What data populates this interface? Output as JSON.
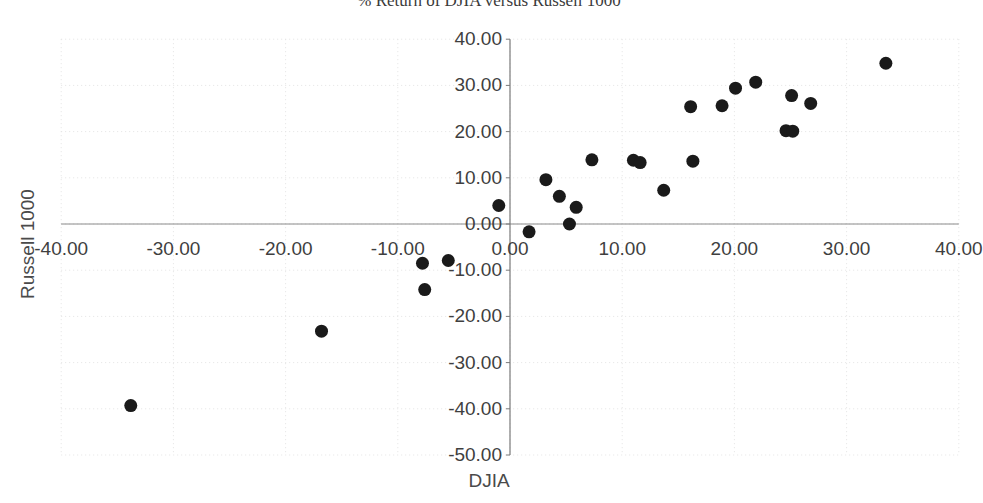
{
  "chart_data": {
    "type": "scatter",
    "title": "% Return of DJIA versus Russell 1000",
    "xlabel": "DJIA",
    "ylabel": "Russell 1000",
    "xlim": [
      -40,
      40
    ],
    "ylim": [
      -50,
      40
    ],
    "xticks": [
      "-40.00",
      "-30.00",
      "-20.00",
      "-10.00",
      "0.00",
      "10.00",
      "20.00",
      "30.00",
      "40.00"
    ],
    "xtick_values": [
      -40,
      -30,
      -20,
      -10,
      0,
      10,
      20,
      30,
      40
    ],
    "yticks": [
      "40.00",
      "30.00",
      "20.00",
      "10.00",
      "0.00",
      "-10.00",
      "-20.00",
      "-30.00",
      "-40.00",
      "-50.00"
    ],
    "ytick_values": [
      40,
      30,
      20,
      10,
      0,
      -10,
      -20,
      -30,
      -40,
      -50
    ],
    "grid": true,
    "legend": false,
    "marker_color": "#1a1a1a",
    "marker_size": 13,
    "points": [
      {
        "x": -33.8,
        "y": -39.3
      },
      {
        "x": -16.8,
        "y": -23.2
      },
      {
        "x": -7.6,
        "y": -14.2
      },
      {
        "x": -7.8,
        "y": -8.5
      },
      {
        "x": -5.5,
        "y": -7.9
      },
      {
        "x": -1.0,
        "y": 4.0
      },
      {
        "x": 1.7,
        "y": -1.7
      },
      {
        "x": 3.2,
        "y": 9.6
      },
      {
        "x": 4.4,
        "y": 6.0
      },
      {
        "x": 5.3,
        "y": 0.0
      },
      {
        "x": 5.9,
        "y": 3.6
      },
      {
        "x": 7.3,
        "y": 13.9
      },
      {
        "x": 11.0,
        "y": 13.8
      },
      {
        "x": 11.6,
        "y": 13.3
      },
      {
        "x": 13.7,
        "y": 7.3
      },
      {
        "x": 16.1,
        "y": 25.4
      },
      {
        "x": 16.3,
        "y": 13.6
      },
      {
        "x": 18.9,
        "y": 25.6
      },
      {
        "x": 20.1,
        "y": 29.4
      },
      {
        "x": 21.9,
        "y": 30.7
      },
      {
        "x": 24.6,
        "y": 20.2
      },
      {
        "x": 25.1,
        "y": 27.8
      },
      {
        "x": 25.2,
        "y": 20.1
      },
      {
        "x": 26.8,
        "y": 26.1
      },
      {
        "x": 33.5,
        "y": 34.8
      }
    ]
  }
}
